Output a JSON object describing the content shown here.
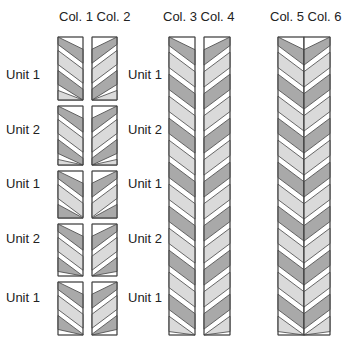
{
  "headers": [
    {
      "label": "Col. 1 Col. 2",
      "x": 59
    },
    {
      "label": "Col. 3 Col. 4",
      "x": 163
    },
    {
      "label": "Col. 5 Col. 6",
      "x": 270
    }
  ],
  "group_a_labels": [
    {
      "label": "Unit 1",
      "y": 67
    },
    {
      "label": "Unit 2",
      "y": 122
    },
    {
      "label": "Unit 1",
      "y": 176
    },
    {
      "label": "Unit 2",
      "y": 231
    },
    {
      "label": "Unit 1",
      "y": 290
    }
  ],
  "group_b_labels": [
    {
      "label": "Unit 1",
      "y": 67
    },
    {
      "label": "Unit 2",
      "y": 122
    },
    {
      "label": "Unit 1",
      "y": 176
    },
    {
      "label": "Unit 2",
      "y": 231
    },
    {
      "label": "Unit 1",
      "y": 290
    }
  ],
  "colors": {
    "dark": "#a9a9a9",
    "light": "#dadada",
    "white": "#ffffff",
    "stroke": "#444444"
  }
}
